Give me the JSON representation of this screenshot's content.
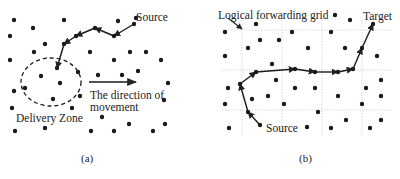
{
  "panel_a": {
    "caption": "(a)",
    "source_label": "Source",
    "zone_label": "Delivery Zone",
    "direction_label_line1": "The direction of",
    "direction_label_line2": "movement",
    "dots": [
      [
        14,
        20
      ],
      [
        64,
        20
      ],
      [
        118,
        21
      ],
      [
        10,
        36
      ],
      [
        33,
        28
      ],
      [
        45,
        44
      ],
      [
        34,
        52
      ],
      [
        10,
        60
      ],
      [
        90,
        52
      ],
      [
        130,
        52
      ],
      [
        146,
        52
      ],
      [
        114,
        60
      ],
      [
        161,
        60
      ],
      [
        41,
        76
      ],
      [
        60,
        83
      ],
      [
        78,
        72
      ],
      [
        98,
        75
      ],
      [
        122,
        75
      ],
      [
        138,
        71
      ],
      [
        14,
        91
      ],
      [
        25,
        88
      ],
      [
        53,
        99
      ],
      [
        80,
        96
      ],
      [
        12,
        108
      ],
      [
        72,
        108
      ],
      [
        102,
        117
      ],
      [
        129,
        124
      ],
      [
        165,
        124
      ],
      [
        15,
        131
      ],
      [
        45,
        128
      ],
      [
        91,
        131
      ],
      [
        114,
        131
      ],
      [
        153,
        131
      ],
      [
        168,
        83
      ],
      [
        164,
        100
      ],
      [
        136,
        18
      ]
    ],
    "path": [
      [
        134,
        24
      ],
      [
        114,
        36
      ],
      [
        95,
        28
      ],
      [
        76,
        36
      ],
      [
        64,
        44
      ],
      [
        57,
        68
      ]
    ],
    "zone": {
      "cx": 51,
      "cy": 82,
      "rx": 30,
      "ry": 24
    },
    "arrow": {
      "x1": 89,
      "y1": 82,
      "x2": 136,
      "y2": 82
    }
  },
  "panel_b": {
    "caption": "(b)",
    "grid_label": "Logical forwarding grid",
    "target_label": "Target",
    "source_label": "Source",
    "grid": {
      "x": [
        242,
        282,
        322,
        362
      ],
      "y": [
        30,
        70,
        110
      ],
      "x0": 222,
      "x1": 392,
      "y0": 20,
      "y1": 135
    },
    "dots": [
      [
        225,
        32
      ],
      [
        256,
        24
      ],
      [
        260,
        40
      ],
      [
        279,
        40
      ],
      [
        248,
        48
      ],
      [
        292,
        32
      ],
      [
        225,
        56
      ],
      [
        272,
        64
      ],
      [
        308,
        48
      ],
      [
        335,
        15
      ],
      [
        350,
        20
      ],
      [
        331,
        32
      ],
      [
        345,
        48
      ],
      [
        377,
        56
      ],
      [
        228,
        88
      ],
      [
        276,
        80
      ],
      [
        295,
        88
      ],
      [
        315,
        88
      ],
      [
        225,
        104
      ],
      [
        252,
        99
      ],
      [
        268,
        96
      ],
      [
        284,
        104
      ],
      [
        318,
        112
      ],
      [
        338,
        96
      ],
      [
        366,
        88
      ],
      [
        381,
        80
      ],
      [
        381,
        96
      ],
      [
        362,
        104
      ],
      [
        229,
        128
      ],
      [
        307,
        127
      ],
      [
        331,
        128
      ],
      [
        346,
        120
      ],
      [
        370,
        128
      ],
      [
        381,
        120
      ]
    ],
    "path": [
      [
        260,
        125
      ],
      [
        248,
        112
      ],
      [
        240,
        84
      ],
      [
        256,
        72
      ],
      [
        295,
        69
      ],
      [
        315,
        72
      ],
      [
        338,
        72
      ],
      [
        353,
        69
      ],
      [
        362,
        48
      ],
      [
        373,
        24
      ]
    ],
    "path_source": [
      260,
      125
    ],
    "path_target": [
      373,
      24
    ]
  }
}
